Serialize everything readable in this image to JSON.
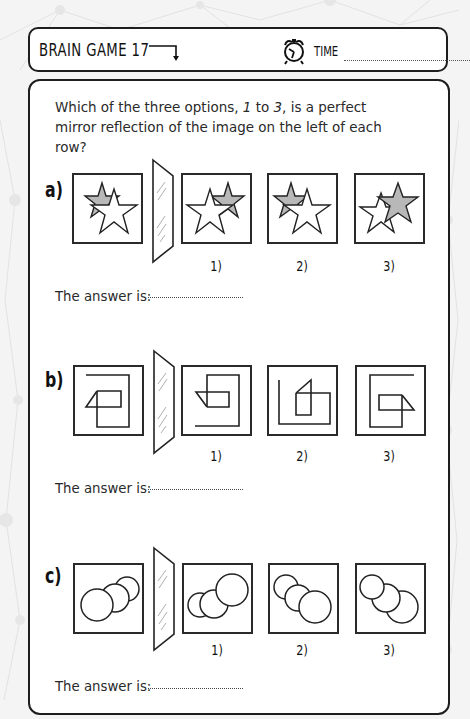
{
  "header": {
    "title": "BRAIN GAME 17",
    "arrow_icon": "arrow-right-down-icon",
    "clock_icon": "alarm-clock-icon",
    "time_label": "TIME",
    "time_value": ""
  },
  "instructions": {
    "part1": "Which of the three options, ",
    "opt_start": "1",
    "part2": " to ",
    "opt_end": "3",
    "part3": ", is a perfect mirror reflection of the image on the left of each row?"
  },
  "rows": [
    {
      "label": "a)",
      "theme": "stars",
      "options": [
        {
          "label": "1)"
        },
        {
          "label": "2)"
        },
        {
          "label": "3)"
        }
      ],
      "answer_label": "The answer is:",
      "answer_value": ""
    },
    {
      "label": "b)",
      "theme": "lines",
      "options": [
        {
          "label": "1)"
        },
        {
          "label": "2)"
        },
        {
          "label": "3)"
        }
      ],
      "answer_label": "The answer is:",
      "answer_value": ""
    },
    {
      "label": "c)",
      "theme": "circles",
      "options": [
        {
          "label": "1)"
        },
        {
          "label": "2)"
        },
        {
          "label": "3)"
        }
      ],
      "answer_label": "The answer is:",
      "answer_value": ""
    }
  ],
  "colors": {
    "ink": "#1e1e1e",
    "star_fill_gray": "#b8b8b8",
    "background": "#f4f4f4",
    "panel": "#ffffff"
  }
}
